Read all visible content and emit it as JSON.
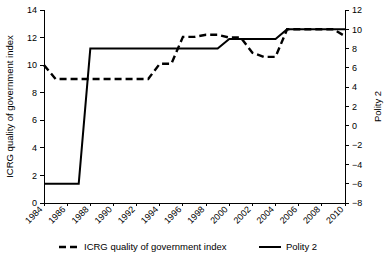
{
  "chart_data": {
    "type": "line",
    "title": "",
    "xlabel": "",
    "ylabel": "ICRG quality of government index",
    "y2label": "Polity 2",
    "grid": false,
    "legend_position": "bottom",
    "x": [
      1984,
      1985,
      1986,
      1987,
      1988,
      1989,
      1990,
      1991,
      1992,
      1993,
      1994,
      1995,
      1996,
      1997,
      1998,
      1999,
      2000,
      2001,
      2002,
      2003,
      2004,
      2005,
      2006,
      2007,
      2008,
      2009,
      2010
    ],
    "xlim": [
      1984,
      2010
    ],
    "xticks": [
      1984,
      1986,
      1988,
      1990,
      1992,
      1994,
      1996,
      1998,
      2000,
      2002,
      2004,
      2006,
      2008,
      2010
    ],
    "xtick_labels": [
      "1984",
      "1986",
      "1988",
      "1990",
      "1992",
      "1994",
      "1996",
      "1998",
      "2000",
      "2002",
      "2004",
      "2006",
      "2008",
      "2010"
    ],
    "ylim": [
      0,
      14
    ],
    "yticks": [
      0,
      2,
      4,
      6,
      8,
      10,
      12,
      14
    ],
    "ytick_labels": [
      "0",
      "2",
      "4",
      "6",
      "8",
      "10",
      "12",
      "14"
    ],
    "y2lim": [
      -8,
      12
    ],
    "y2ticks": [
      -8,
      -6,
      -4,
      -2,
      0,
      2,
      4,
      6,
      8,
      10,
      12
    ],
    "y2tick_labels": [
      "−8",
      "−6",
      "−4",
      "−2",
      "0",
      "2",
      "4",
      "6",
      "8",
      "10",
      "12"
    ],
    "series": [
      {
        "name": "ICRG quality of government index",
        "axis": "left",
        "style": "dashed",
        "color": "#000000",
        "values": [
          10.0,
          9.0,
          9.0,
          9.0,
          9.0,
          9.0,
          9.0,
          9.0,
          9.0,
          9.0,
          10.1,
          10.1,
          12.05,
          12.05,
          12.2,
          12.2,
          12.0,
          12.0,
          10.9,
          10.6,
          10.6,
          12.6,
          12.6,
          12.6,
          12.6,
          12.6,
          12.1
        ]
      },
      {
        "name": "Polity 2",
        "axis": "right",
        "style": "solid",
        "color": "#000000",
        "values": [
          -6,
          -6,
          -6,
          -6,
          8,
          8,
          8,
          8,
          8,
          8,
          8,
          8,
          8,
          8,
          8,
          8,
          9,
          9,
          9,
          9,
          9,
          10,
          10,
          10,
          10,
          10,
          10
        ]
      }
    ],
    "legend": [
      {
        "label": "ICRG quality of government index",
        "style": "dashed"
      },
      {
        "label": "Polity 2",
        "style": "solid"
      }
    ]
  }
}
